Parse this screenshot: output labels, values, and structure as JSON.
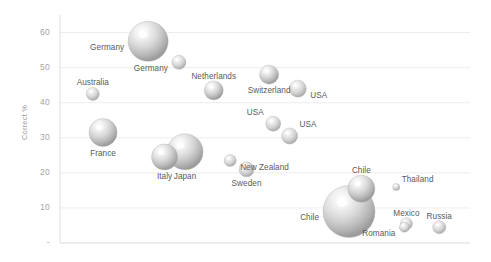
{
  "chart_data": {
    "type": "scatter",
    "title": "",
    "subtitle": "",
    "xlabel": "",
    "ylabel": "Correct %",
    "ylim": [
      0,
      65
    ],
    "xlim": [
      0,
      100
    ],
    "grid": true,
    "legend": "none",
    "y_ticks": [
      "-",
      "10",
      "20",
      "30",
      "40",
      "50",
      "60"
    ],
    "y_tick_values": [
      0,
      10,
      20,
      30,
      40,
      50,
      60
    ],
    "x_ticks": [],
    "marker_style": "3d-sphere-grey",
    "points": [
      {
        "label": "Germany",
        "x": 21.5,
        "y": 57.5,
        "size": 40,
        "label_pos": "left"
      },
      {
        "label": "Germany",
        "x": 29.0,
        "y": 51.5,
        "size": 14,
        "label_pos": "left"
      },
      {
        "label": "Australia",
        "x": 8.0,
        "y": 42.5,
        "size": 13,
        "label_pos": "above"
      },
      {
        "label": "Netherlands",
        "x": 37.5,
        "y": 43.5,
        "size": 19,
        "label_pos": "above"
      },
      {
        "label": "Switzerland",
        "x": 51.0,
        "y": 48.0,
        "size": 19,
        "label_pos": "below"
      },
      {
        "label": "USA",
        "x": 58.0,
        "y": 44.0,
        "size": 17,
        "label_pos": "right"
      },
      {
        "label": "USA",
        "x": 52.0,
        "y": 34.0,
        "size": 15,
        "label_pos": "above-left"
      },
      {
        "label": "USA",
        "x": 56.0,
        "y": 30.5,
        "size": 16,
        "label_pos": "above-right"
      },
      {
        "label": "France",
        "x": 10.5,
        "y": 31.5,
        "size": 28,
        "label_pos": "below"
      },
      {
        "label": "Italy",
        "x": 25.5,
        "y": 24.5,
        "size": 26,
        "label_pos": "below"
      },
      {
        "label": "Japan",
        "x": 30.5,
        "y": 26.0,
        "size": 36,
        "label_pos": "below"
      },
      {
        "label": "New Zealand",
        "x": 41.5,
        "y": 23.5,
        "size": 12,
        "label_pos": "right"
      },
      {
        "label": "Sweden",
        "x": 45.5,
        "y": 21.0,
        "size": 15,
        "label_pos": "below"
      },
      {
        "label": "Chile",
        "x": 73.5,
        "y": 15.5,
        "size": 27,
        "label_pos": "above"
      },
      {
        "label": "Thailand",
        "x": 82.0,
        "y": 16.0,
        "size": 7,
        "label_pos": "above-right"
      },
      {
        "label": "Chile",
        "x": 70.5,
        "y": 9.0,
        "size": 52,
        "label_pos": "left"
      },
      {
        "label": "Mexico",
        "x": 84.5,
        "y": 5.5,
        "size": 12,
        "label_pos": "above"
      },
      {
        "label": "Romania",
        "x": 84.0,
        "y": 4.5,
        "size": 10,
        "label_pos": "left"
      },
      {
        "label": "Russia",
        "x": 92.5,
        "y": 4.5,
        "size": 13,
        "label_pos": "above"
      }
    ]
  },
  "axis": {
    "y_label": "Correct %"
  },
  "colors": {
    "bubble_light": "#f4f4f4",
    "bubble_mid": "#cfcfcf",
    "bubble_dark": "#9e9e9e",
    "gridline": "#ededed",
    "axisline": "#e2e2e2",
    "tick_text": "#a6a6a6",
    "label_text": "#5a5a5a",
    "background": "#ffffff"
  }
}
